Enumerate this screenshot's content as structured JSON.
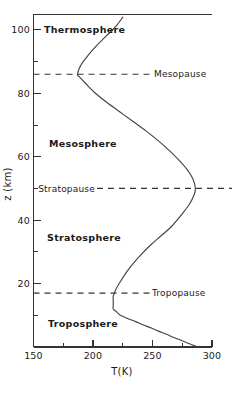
{
  "chart_data": {
    "type": "line",
    "title": "",
    "subtitle": "",
    "xlabel": "T(K)",
    "ylabel": "z (km)",
    "xlim": [
      150,
      300
    ],
    "ylim": [
      0,
      105
    ],
    "grid": false,
    "legend_position": "none",
    "orientation": "temperature on x-axis, altitude on y-axis",
    "x_ticks": [
      150,
      200,
      250,
      300
    ],
    "x_tick_labels": [
      "150",
      "200",
      "250",
      "300"
    ],
    "x_minor_ticks": [
      175,
      225,
      275
    ],
    "y_ticks": [
      20,
      40,
      60,
      80,
      100
    ],
    "y_tick_labels": [
      "20",
      "40",
      "60",
      "80",
      "100"
    ],
    "y_minor_ticks": [
      10,
      30,
      50,
      70,
      90,
      100
    ],
    "series": [
      {
        "name": "US Standard Atmosphere temperature profile",
        "x_values_K": [
          288,
          281,
          275,
          268,
          262,
          255,
          249,
          242,
          236,
          229,
          223,
          220,
          217,
          217,
          217,
          217,
          217,
          219,
          222,
          227,
          233,
          240,
          248,
          257,
          266,
          275,
          281,
          285,
          286,
          284,
          279,
          272,
          264,
          255,
          245,
          234,
          223,
          212,
          202,
          194,
          189,
          187,
          190,
          196,
          203,
          211,
          219,
          225
        ],
        "y_values_km": [
          0,
          1,
          2,
          3,
          4,
          5,
          6,
          7,
          8,
          9,
          10,
          11,
          12,
          13,
          14,
          15,
          16,
          18,
          20,
          23,
          26,
          29,
          32,
          35,
          38,
          42,
          45,
          48,
          50,
          53,
          56,
          59,
          62,
          65,
          68,
          71,
          74,
          77,
          80,
          83,
          85,
          86,
          89,
          92,
          95,
          98,
          101,
          104
        ]
      }
    ],
    "annotations": [
      {
        "id": "thermosphere",
        "text": "Thermosphere",
        "kind": "layer",
        "altitude_km": 100,
        "bold": true
      },
      {
        "id": "mesopause",
        "text": "Mesopause",
        "kind": "pause",
        "altitude_km": 86,
        "temperature_K": 187,
        "line": "dashed"
      },
      {
        "id": "mesosphere",
        "text": "Mesosphere",
        "kind": "layer",
        "altitude_km": 67,
        "bold": true
      },
      {
        "id": "stratopause",
        "text": "Stratopause",
        "kind": "pause",
        "altitude_km": 50,
        "temperature_K": 285,
        "line": "dashed"
      },
      {
        "id": "stratosphere",
        "text": "Stratosphere",
        "kind": "layer",
        "altitude_km": 33,
        "bold": true
      },
      {
        "id": "tropopause",
        "text": "Tropopause",
        "kind": "pause",
        "altitude_km": 17,
        "temperature_K": 217,
        "line": "dashed"
      },
      {
        "id": "troposphere",
        "text": "Troposphere",
        "kind": "layer",
        "altitude_km": 8,
        "bold": true
      }
    ],
    "colors": {
      "curve": "#444444",
      "axis": "#333333",
      "text": "#1a1a1a",
      "background": "#ffffff"
    }
  },
  "labels": {
    "x_axis_title": "T(K)",
    "y_axis_title": "z (km)",
    "thermosphere": "Thermosphere",
    "mesosphere": "Mesosphere",
    "stratosphere": "Stratosphere",
    "troposphere": "Troposphere",
    "mesopause": "Mesopause",
    "stratopause": "Stratopause",
    "tropopause": "Tropopause",
    "x_tick_150": "150",
    "x_tick_200": "200",
    "x_tick_250": "250",
    "x_tick_300": "300",
    "y_tick_20": "20",
    "y_tick_40": "40",
    "y_tick_60": "60",
    "y_tick_80": "80",
    "y_tick_100": "100"
  }
}
